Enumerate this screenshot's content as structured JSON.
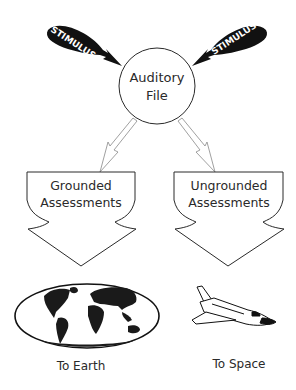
{
  "diagram": {
    "stimulus_left": {
      "label": "STIMULUS"
    },
    "stimulus_right": {
      "label": "STIMULUS"
    },
    "center_node": {
      "line1": "Auditory",
      "line2": "File"
    },
    "left_branch": {
      "line1": "Grounded",
      "line2": "Assessments",
      "destination": "To Earth",
      "icon": "world-map-icon"
    },
    "right_branch": {
      "line1": "Ungrounded",
      "line2": "Assessments",
      "destination": "To Space",
      "icon": "space-shuttle-icon"
    }
  },
  "colors": {
    "stroke": "#2a2a2a",
    "fill_dark": "#111111",
    "background": "#ffffff",
    "thin_arrow": "#888888"
  }
}
